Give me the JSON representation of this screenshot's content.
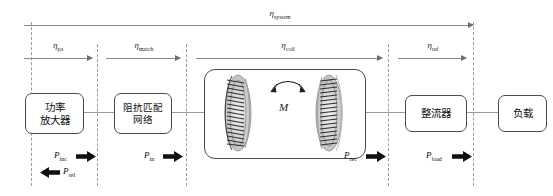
{
  "diagram": {
    "colors": {
      "box_border": "#4a4a4a",
      "dashed_line": "#9a9a9a",
      "wire": "#9b9b9b",
      "arrow": "#6f6f6f",
      "power_arrow": "#101010",
      "background": "#ffffff"
    }
  },
  "efficiencies": {
    "system": {
      "symbol": "η",
      "subscript": "system"
    },
    "pa": {
      "symbol": "η",
      "subscript": "pa"
    },
    "match": {
      "symbol": "η",
      "subscript": "match"
    },
    "coil": {
      "symbol": "η",
      "subscript": "coil"
    },
    "ref": {
      "symbol": "η",
      "subscript": "ref"
    }
  },
  "blocks": [
    {
      "id": "power-amplifier",
      "line1": "功率",
      "line2": "放大器"
    },
    {
      "id": "impedance-matching-network",
      "line1": "阻抗匹配",
      "line2": "网络"
    },
    {
      "id": "rectifier",
      "line1": "整流器",
      "line2": ""
    },
    {
      "id": "load",
      "line1": "负载",
      "line2": ""
    }
  ],
  "coupling": {
    "mutual_inductance_label": "M",
    "coil_count": 2
  },
  "powers": [
    {
      "id": "p-inc",
      "symbol": "P",
      "subscript": "inc",
      "direction": "right"
    },
    {
      "id": "p-ref",
      "symbol": "P",
      "subscript": "ref",
      "direction": "left"
    },
    {
      "id": "p-in",
      "symbol": "P",
      "subscript": "in",
      "direction": "right"
    },
    {
      "id": "p-rec",
      "symbol": "P",
      "subscript": "rec",
      "direction": "right"
    },
    {
      "id": "p-load",
      "symbol": "P",
      "subscript": "load",
      "direction": "right"
    }
  ]
}
